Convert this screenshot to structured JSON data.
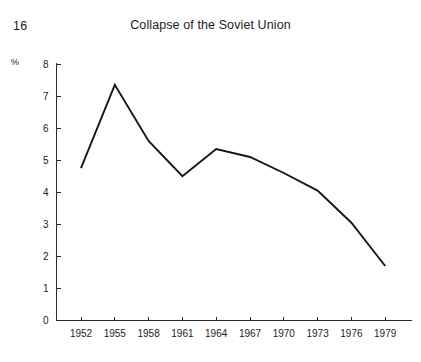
{
  "page": {
    "number": "16"
  },
  "chart_data": {
    "type": "line",
    "title": "Collapse of the Soviet Union",
    "xlabel": "",
    "ylabel": "%",
    "unit_label": "%",
    "categories": [
      "1952",
      "1955",
      "1958",
      "1961",
      "1964",
      "1967",
      "1970",
      "1973",
      "1976",
      "1979"
    ],
    "x": [
      1952,
      1955,
      1958,
      1961,
      1964,
      1967,
      1970,
      1973,
      1976,
      1979
    ],
    "values": [
      4.75,
      7.35,
      5.6,
      4.5,
      5.35,
      5.1,
      4.6,
      4.05,
      3.05,
      1.7
    ],
    "series": [
      {
        "name": "Soviet economic growth rate",
        "values": [
          4.75,
          7.35,
          5.6,
          4.5,
          5.35,
          5.1,
          4.6,
          4.05,
          3.05,
          1.7
        ]
      }
    ],
    "xlim": [
      1952,
      1979
    ],
    "ylim": [
      0,
      8
    ],
    "ytick_labels": [
      "0",
      "1",
      "2",
      "3",
      "4",
      "5",
      "6",
      "7",
      "8"
    ],
    "ytick_values": [
      0,
      1,
      2,
      3,
      4,
      5,
      6,
      7,
      8
    ],
    "xtick_labels": [
      "1952",
      "1955",
      "1958",
      "1961",
      "1964",
      "1967",
      "1970",
      "1973",
      "1976",
      "1979"
    ],
    "grid": false,
    "legend": "none",
    "line_color": "#161616",
    "axis_color": "#2b2b2b",
    "background_color": "#ffffff"
  }
}
